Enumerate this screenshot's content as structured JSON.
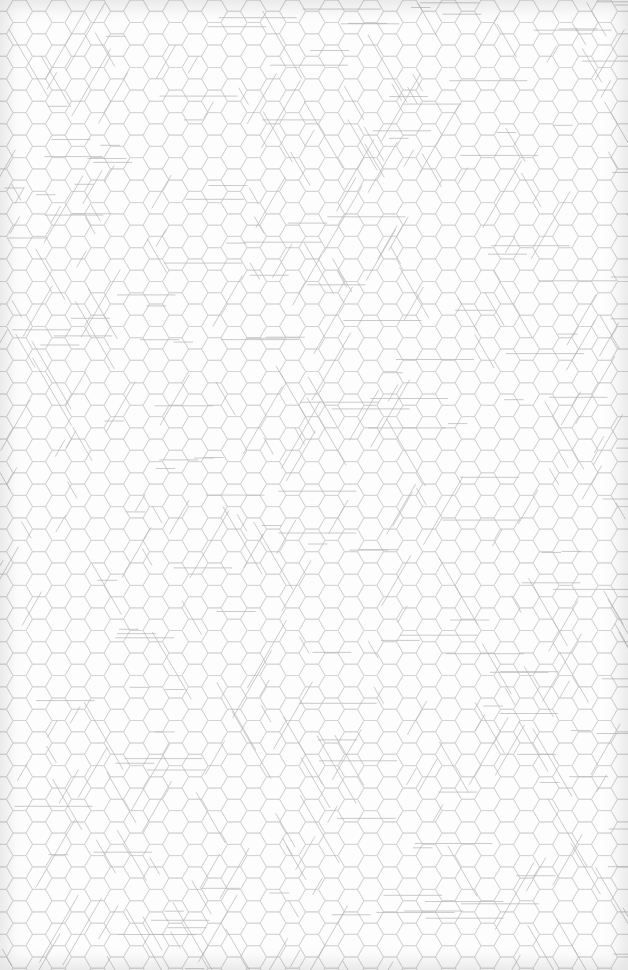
{
  "page": {
    "background": "#fdfdfd",
    "hex_stroke": "#d2d2d2",
    "tri_stroke": "#b4b4b4",
    "hex_size": 13
  }
}
